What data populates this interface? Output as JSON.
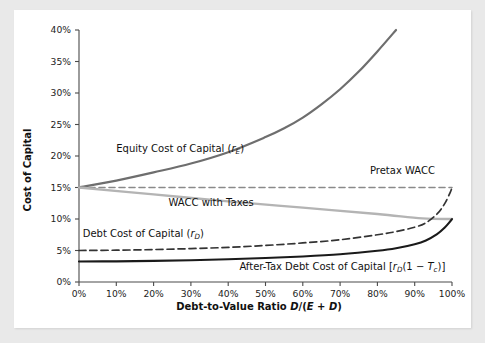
{
  "chart_data": {
    "type": "line",
    "title": "",
    "xlabel": "Debt-to-Value Ratio D/(E + D)",
    "ylabel": "Cost of Capital",
    "xlim": [
      0,
      100
    ],
    "ylim": [
      0,
      40
    ],
    "grid": false,
    "legend_position": "inline-annotations",
    "x_tick_labels": [
      "0%",
      "10%",
      "20%",
      "30%",
      "40%",
      "50%",
      "60%",
      "70%",
      "80%",
      "90%",
      "100%"
    ],
    "x_ticks": [
      0,
      10,
      20,
      30,
      40,
      50,
      60,
      70,
      80,
      90,
      100
    ],
    "y_tick_labels": [
      "0%",
      "5%",
      "10%",
      "15%",
      "20%",
      "25%",
      "30%",
      "35%",
      "40%"
    ],
    "y_ticks": [
      0,
      5,
      10,
      15,
      20,
      25,
      30,
      35,
      40
    ],
    "series": [
      {
        "name": "Equity Cost of Capital (rE)",
        "label": "Equity Cost of Capital (r",
        "label_sub": "E",
        "label_tail": ")",
        "color": "#6e6e6e",
        "width": 2.2,
        "dash": "none",
        "x": [
          0,
          10,
          20,
          30,
          40,
          50,
          55,
          60,
          65,
          70,
          75,
          80,
          85
        ],
        "y": [
          15.0,
          16.1,
          17.4,
          18.8,
          20.6,
          23.0,
          24.4,
          26.1,
          28.2,
          30.6,
          33.4,
          36.6,
          40.0
        ]
      },
      {
        "name": "Pretax WACC",
        "label": "Pretax WACC",
        "color": "#8a8a8a",
        "width": 1.6,
        "dash": "6,4",
        "x": [
          0,
          100
        ],
        "y": [
          15.0,
          15.0
        ]
      },
      {
        "name": "WACC with Taxes",
        "label": "WACC with Taxes",
        "color": "#b4b4b4",
        "width": 2.4,
        "dash": "none",
        "x": [
          0,
          20,
          40,
          60,
          80,
          92,
          100
        ],
        "y": [
          15.0,
          13.9,
          12.8,
          11.8,
          10.8,
          10.1,
          10.0
        ]
      },
      {
        "name": "Debt Cost of Capital (rD)",
        "label": "Debt Cost of Capital (r",
        "label_sub": "D",
        "label_tail": ")",
        "color": "#333333",
        "width": 1.7,
        "dash": "7,4",
        "x": [
          0,
          10,
          20,
          30,
          40,
          50,
          60,
          70,
          80,
          85,
          90,
          93,
          96,
          98,
          99.5,
          100
        ],
        "y": [
          5.0,
          5.05,
          5.15,
          5.3,
          5.5,
          5.8,
          6.2,
          6.7,
          7.5,
          8.0,
          8.7,
          9.4,
          10.8,
          12.4,
          14.2,
          15.0
        ]
      },
      {
        "name": "After-Tax Debt Cost of Capital [rD(1 - Tc)]",
        "label": "After-Tax Debt Cost of Capital [r",
        "label_sub": "D",
        "label_tail": "(1 − T",
        "label_sub2": "c",
        "label_tail2": ")]",
        "color": "#1a1a1a",
        "width": 2.1,
        "dash": "none",
        "x": [
          0,
          10,
          20,
          30,
          40,
          50,
          60,
          70,
          80,
          85,
          90,
          93,
          96,
          98,
          99.5,
          100
        ],
        "y": [
          3.25,
          3.28,
          3.35,
          3.45,
          3.6,
          3.8,
          4.05,
          4.4,
          4.95,
          5.35,
          6.0,
          6.6,
          7.6,
          8.6,
          9.6,
          10.0
        ]
      }
    ],
    "annotations": [
      {
        "id": "equity",
        "text": "Equity Cost of Capital (rE)",
        "x": 10,
        "y": 20.6
      },
      {
        "id": "pretax",
        "text": "Pretax WACC",
        "x": 78,
        "y": 17.2
      },
      {
        "id": "wacc-taxes",
        "text": "WACC with Taxes",
        "x": 24,
        "y": 12.1
      },
      {
        "id": "debt",
        "text": "Debt Cost of Capital (rD)",
        "x": 1,
        "y": 7.1
      },
      {
        "id": "after-tax",
        "text": "After-Tax Debt Cost of Capital [rD(1 - Tc)]",
        "x": 43,
        "y": 1.9
      }
    ]
  },
  "axes": {
    "y_title": "Cost of Capital",
    "x_title_main": "Debt-to-Value Ratio ",
    "x_title_formula_d": "D",
    "x_title_slash": "/(",
    "x_title_e": "E",
    "x_title_plus": " + ",
    "x_title_d2": "D",
    "x_title_close": ")"
  },
  "labels": {
    "equity_main": "Equity Cost of Capital (",
    "equity_var": "r",
    "equity_sub": "E",
    "equity_close": ")",
    "pretax": "Pretax WACC",
    "wacc_taxes": "WACC with Taxes",
    "debt_main": "Debt Cost of Capital (",
    "debt_var": "r",
    "debt_sub": "D",
    "debt_close": ")",
    "aftertax_main": "After-Tax Debt Cost of Capital [",
    "aftertax_var": "r",
    "aftertax_sub": "D",
    "aftertax_mid": "(1 − ",
    "aftertax_var2": "T",
    "aftertax_sub2": "c",
    "aftertax_close": ")]"
  },
  "colors": {
    "equity": "#6e6e6e",
    "pretax_wacc": "#8a8a8a",
    "wacc_with_taxes": "#b4b4b4",
    "debt": "#333333",
    "after_tax_debt": "#1a1a1a",
    "axis": "#4a4a4a",
    "card_background": "#ffffff",
    "page_background": "#e9e9e9",
    "text": "#111111"
  }
}
